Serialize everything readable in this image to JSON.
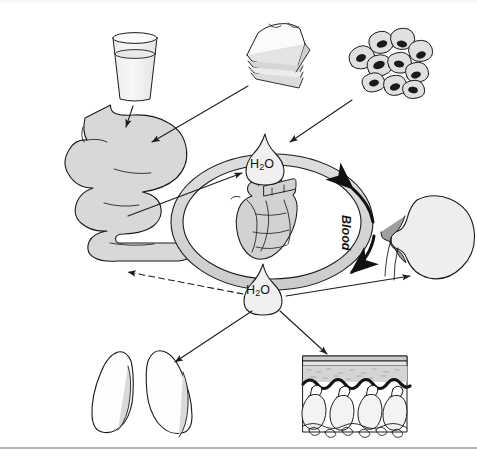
{
  "figure": {
    "domain_note": "physiology water-balance flow diagram",
    "background_color": "#ffffff",
    "line_color": "#1b1b1b",
    "organ_fill": "#d8d8d8",
    "vessel_fill": "#d4d4d4",
    "nucleus_color": "#1a1a1a"
  },
  "labels": {
    "water_top": {
      "formula": "H",
      "sub": "2",
      "tail": "O"
    },
    "water_bottom": {
      "formula": "H",
      "sub": "2",
      "tail": "O"
    },
    "blood": "Blood"
  },
  "nodes": [
    {
      "id": "glass-of-water",
      "name": "glass-of-water",
      "role": "water intake source",
      "x": 135,
      "y": 62
    },
    {
      "id": "sandwich-food",
      "name": "sandwich-food",
      "role": "water in food source",
      "x": 272,
      "y": 52
    },
    {
      "id": "cell-cluster",
      "name": "cell-cluster",
      "role": "metabolic water source",
      "x": 392,
      "y": 66
    },
    {
      "id": "stomach-intestine",
      "name": "stomach-and-intestines",
      "role": "digestive tract",
      "x": 88,
      "y": 195
    },
    {
      "id": "blood-vessel-ring",
      "name": "blood-vessel-ring",
      "role": "circulation",
      "x": 272,
      "y": 222
    },
    {
      "id": "heart",
      "name": "heart",
      "role": "pump",
      "x": 272,
      "y": 222
    },
    {
      "id": "water-droplet-top",
      "name": "water-droplet-intake",
      "role": "water entering blood",
      "x": 265,
      "y": 160
    },
    {
      "id": "water-droplet-bottom",
      "name": "water-droplet-output",
      "role": "water leaving blood",
      "x": 263,
      "y": 290
    },
    {
      "id": "kidney",
      "name": "kidney",
      "role": "urinary water loss",
      "x": 430,
      "y": 243
    },
    {
      "id": "lungs",
      "name": "lungs",
      "role": "respiratory water loss",
      "x": 156,
      "y": 390
    },
    {
      "id": "skin-section",
      "name": "skin-cross-section",
      "role": "sweat water loss",
      "x": 355,
      "y": 390
    }
  ],
  "edges": [
    {
      "from": "glass-of-water",
      "to": "stomach-intestine",
      "style": "solid"
    },
    {
      "from": "sandwich-food",
      "to": "stomach-intestine",
      "style": "solid"
    },
    {
      "from": "cell-cluster",
      "to": "water-droplet-top",
      "style": "solid"
    },
    {
      "from": "stomach-intestine",
      "to": "water-droplet-top",
      "style": "solid"
    },
    {
      "from": "water-droplet-bottom",
      "to": "stomach-intestine",
      "style": "dashed"
    },
    {
      "from": "water-droplet-bottom",
      "to": "kidney",
      "style": "solid"
    },
    {
      "from": "water-droplet-bottom",
      "to": "lungs",
      "style": "solid"
    },
    {
      "from": "water-droplet-bottom",
      "to": "skin-section",
      "style": "solid"
    },
    {
      "from": "blood-vessel-ring",
      "to": "blood-vessel-ring",
      "style": "curved-arrow",
      "label": "Blood"
    }
  ]
}
